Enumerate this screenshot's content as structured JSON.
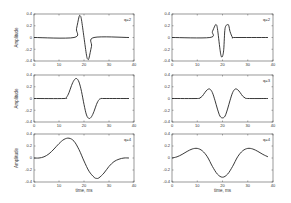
{
  "figure": {
    "rows": 3,
    "cols": 2,
    "xlim": [
      0,
      40
    ],
    "ylim": [
      -0.4,
      0.4
    ],
    "xticks": [
      "0",
      "10",
      "20",
      "30",
      "40"
    ],
    "yticks": [
      "0.4",
      "0.2",
      "0",
      "-0.2",
      "-0.4"
    ],
    "ylabel": "Amplitude",
    "xlabel": "time, ms",
    "line_color": "#222222",
    "frame_color": "#555555"
  },
  "chart_data": [
    {
      "type": "line",
      "panel": "row1-col1",
      "label": "q=2",
      "title": "",
      "xlabel": "",
      "ylabel": "Amplitude",
      "xlim": [
        0,
        40
      ],
      "ylim": [
        -0.4,
        0.4
      ],
      "x": [
        0,
        16,
        17,
        18,
        18.5,
        19,
        20,
        21,
        21.5,
        22,
        23,
        24,
        38
      ],
      "y": [
        0,
        0,
        0.15,
        0.35,
        0.37,
        0.3,
        0,
        -0.3,
        -0.37,
        -0.35,
        -0.15,
        0,
        0
      ]
    },
    {
      "type": "line",
      "panel": "row1-col2",
      "label": "q=2",
      "title": "",
      "xlabel": "",
      "ylabel": "",
      "xlim": [
        0,
        40
      ],
      "ylim": [
        -0.4,
        0.4
      ],
      "x": [
        0,
        15,
        16,
        17,
        17.5,
        18,
        19,
        19.5,
        20,
        20.5,
        21,
        22,
        22.5,
        23,
        24,
        25,
        38
      ],
      "y": [
        0,
        0,
        0.1,
        0.2,
        0.22,
        0.15,
        -0.2,
        -0.32,
        -0.32,
        -0.2,
        0.15,
        0.22,
        0.2,
        0.1,
        0,
        0,
        0
      ]
    },
    {
      "type": "line",
      "panel": "row2-col1",
      "label": "",
      "title": "",
      "xlabel": "",
      "ylabel": "Amplitude",
      "xlim": [
        0,
        40
      ],
      "ylim": [
        -0.4,
        0.4
      ],
      "x": [
        0,
        12,
        13,
        14,
        15,
        16,
        17,
        18,
        19,
        20,
        21,
        22,
        23,
        24,
        25,
        26,
        27,
        28,
        38
      ],
      "y": [
        0,
        0,
        0.02,
        0.1,
        0.22,
        0.31,
        0.34,
        0.28,
        0.12,
        -0.1,
        -0.28,
        -0.34,
        -0.31,
        -0.22,
        -0.1,
        -0.02,
        0,
        0,
        0
      ]
    },
    {
      "type": "line",
      "panel": "row2-col2",
      "label": "q=3",
      "title": "",
      "xlabel": "",
      "ylabel": "",
      "xlim": [
        0,
        40
      ],
      "ylim": [
        -0.4,
        0.4
      ],
      "x": [
        0,
        10,
        11,
        12,
        13,
        14,
        15,
        16,
        17,
        18,
        19,
        20,
        21,
        22,
        23,
        24,
        25,
        26,
        27,
        28,
        29,
        30,
        38
      ],
      "y": [
        0,
        0,
        0.01,
        0.04,
        0.1,
        0.15,
        0.16,
        0.1,
        -0.03,
        -0.18,
        -0.3,
        -0.33,
        -0.3,
        -0.18,
        -0.03,
        0.1,
        0.16,
        0.15,
        0.1,
        0.04,
        0.01,
        0,
        0
      ]
    },
    {
      "type": "line",
      "panel": "row3-col1",
      "label": "q=4",
      "title": "",
      "xlabel": "time, ms",
      "ylabel": "Amplitude",
      "xlim": [
        0,
        40
      ],
      "ylim": [
        -0.4,
        0.4
      ],
      "x": [
        0,
        2,
        4,
        6,
        8,
        10,
        12,
        14,
        16,
        18,
        20,
        22,
        24,
        25,
        26,
        28,
        30,
        32,
        34,
        36,
        38
      ],
      "y": [
        0,
        0,
        0.02,
        0.07,
        0.15,
        0.24,
        0.31,
        0.33,
        0.28,
        0.14,
        -0.05,
        -0.22,
        -0.32,
        -0.34,
        -0.33,
        -0.25,
        -0.14,
        -0.06,
        -0.02,
        0,
        0
      ]
    },
    {
      "type": "line",
      "panel": "row3-col2",
      "label": "q=4",
      "title": "",
      "xlabel": "time, ms",
      "ylabel": "",
      "xlim": [
        0,
        40
      ],
      "ylim": [
        -0.4,
        0.4
      ],
      "x": [
        0,
        2,
        4,
        6,
        8,
        10,
        12,
        14,
        16,
        18,
        20,
        22,
        24,
        26,
        28,
        30,
        32,
        34,
        36,
        38
      ],
      "y": [
        0,
        0.02,
        0.06,
        0.11,
        0.15,
        0.16,
        0.12,
        0.02,
        -0.14,
        -0.27,
        -0.32,
        -0.27,
        -0.14,
        0.02,
        0.12,
        0.16,
        0.15,
        0.11,
        0.06,
        0.02
      ]
    }
  ]
}
